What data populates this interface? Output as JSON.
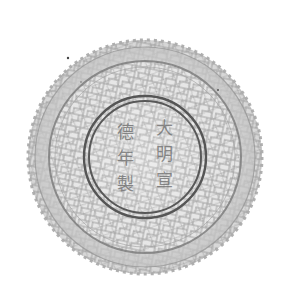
{
  "image": {
    "subject": "crackle-glaze porcelain dish base",
    "background": "#ffffff",
    "glaze_color": "#d8d8d8",
    "crackle_color": "#8a8a8a",
    "ring_color": "#4a4a4a"
  },
  "reign_mark": {
    "text": "大明宣德年製",
    "columns": [
      [
        "大",
        "明",
        "宣"
      ],
      [
        "德",
        "年",
        "製"
      ]
    ]
  }
}
